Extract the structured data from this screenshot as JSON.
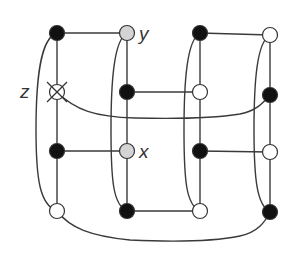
{
  "diagram": {
    "labels": {
      "y": "y",
      "z": "z",
      "x": "x"
    },
    "colors": {
      "edge": "#3a3a3a",
      "black_node": "#111111",
      "white_node": "#ffffff",
      "gray_node": "#d4d4d4",
      "stroke": "#333333"
    },
    "nodes": [
      {
        "id": "c1r1",
        "x": 57,
        "y": 33,
        "fill": "black"
      },
      {
        "id": "c1r2",
        "x": 57,
        "y": 92,
        "fill": "crossed",
        "label": "z"
      },
      {
        "id": "c1r3",
        "x": 57,
        "y": 151,
        "fill": "black"
      },
      {
        "id": "c1r4",
        "x": 57,
        "y": 211,
        "fill": "white"
      },
      {
        "id": "c2r1",
        "x": 127,
        "y": 33,
        "fill": "gray",
        "label": "y"
      },
      {
        "id": "c2r2",
        "x": 127,
        "y": 92,
        "fill": "black"
      },
      {
        "id": "c2r3",
        "x": 127,
        "y": 151,
        "fill": "gray",
        "label": "x"
      },
      {
        "id": "c2r4",
        "x": 127,
        "y": 211,
        "fill": "black"
      },
      {
        "id": "c3r1",
        "x": 200,
        "y": 33,
        "fill": "black"
      },
      {
        "id": "c3r2",
        "x": 200,
        "y": 92,
        "fill": "white"
      },
      {
        "id": "c3r3",
        "x": 200,
        "y": 151,
        "fill": "black"
      },
      {
        "id": "c3r4",
        "x": 200,
        "y": 211,
        "fill": "white"
      },
      {
        "id": "c4r1",
        "x": 270,
        "y": 35,
        "fill": "white"
      },
      {
        "id": "c4r2",
        "x": 270,
        "y": 95,
        "fill": "black"
      },
      {
        "id": "c4r3",
        "x": 270,
        "y": 152,
        "fill": "white"
      },
      {
        "id": "c4r4",
        "x": 270,
        "y": 212,
        "fill": "black"
      }
    ]
  }
}
